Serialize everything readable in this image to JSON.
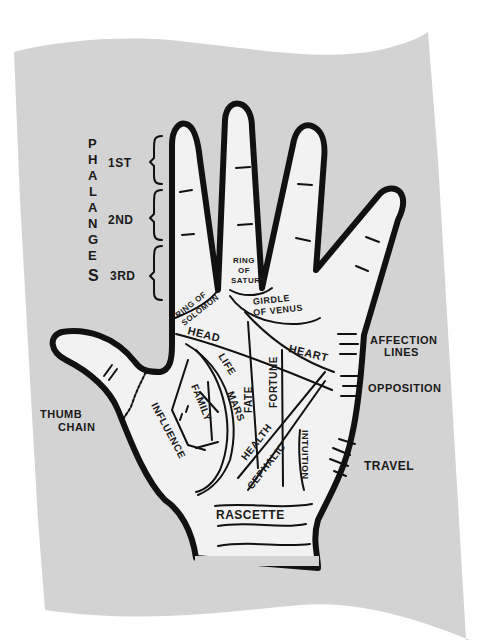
{
  "colors": {
    "background": "#ffffff",
    "paper": "#d3d3d3",
    "palm": "#f2f2f2",
    "ink": "#111111"
  },
  "diagram": {
    "phalanges": {
      "title": "PHALANGES",
      "letters": [
        "P",
        "H",
        "A",
        "L",
        "A",
        "N",
        "G",
        "E",
        "S"
      ],
      "sections": [
        "1ST",
        "2ND",
        "3RD"
      ]
    },
    "rings": {
      "solomon": [
        "RING OF",
        "SOLOMON"
      ],
      "saturn": [
        "RING",
        "OF",
        "SATURN"
      ],
      "venus": [
        "GIRDLE",
        "OF VENUS"
      ]
    },
    "palm_lines": {
      "head": "HEAD",
      "heart": "HEART",
      "life": "LIFE",
      "mars": "MARS",
      "fate": "FATE",
      "fortune": "FORTUNE",
      "family": "FAMILY",
      "influence": "INFLUENCE",
      "health": "HEALTH",
      "cephalic": "CEPHALIC",
      "intuition": "INTUITION",
      "rascette": "RASCETTE"
    },
    "side_labels": {
      "affection": [
        "AFFECTION",
        "LINES"
      ],
      "opposition": "OPPOSITION",
      "travel": "TRAVEL",
      "thumb_chain": [
        "THUMB",
        "CHAIN"
      ]
    }
  }
}
